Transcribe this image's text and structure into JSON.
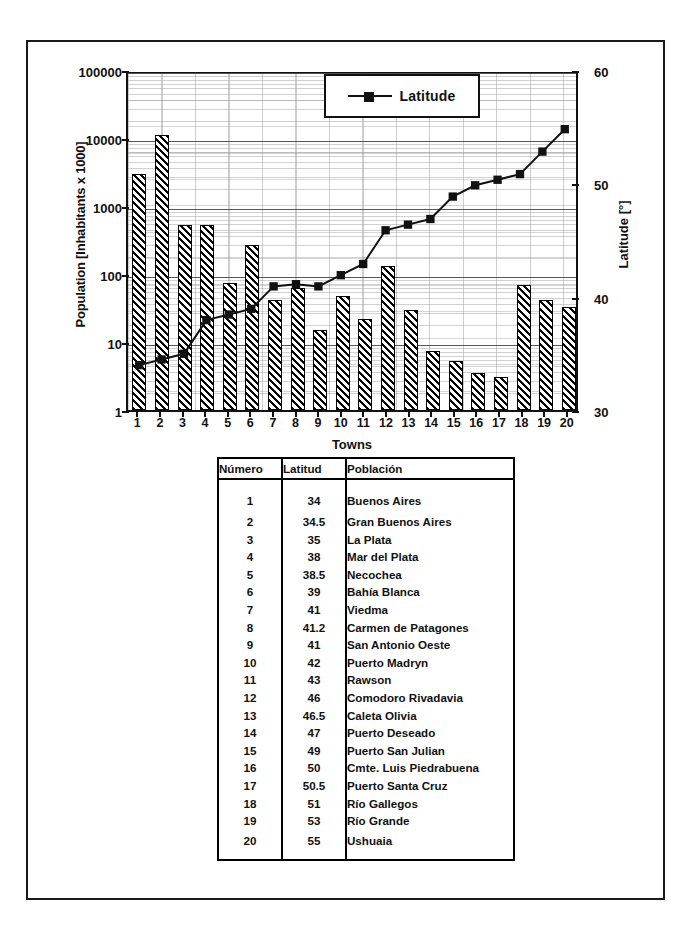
{
  "chart_data": {
    "type": "bar",
    "title": "",
    "xlabel": "Towns",
    "ylabel": "Population [Inhabitants x 1000]",
    "y2label": "Latitude [°]",
    "ylim": [
      1,
      100000
    ],
    "yscale": "log",
    "y2lim": [
      30,
      60
    ],
    "grid": true,
    "legend_position": "top-right",
    "y_ticks": [
      "1",
      "10",
      "100",
      "1000",
      "10000",
      "100000"
    ],
    "y2_ticks": [
      "30",
      "40",
      "50",
      "60"
    ],
    "categories": [
      "1",
      "2",
      "3",
      "4",
      "5",
      "6",
      "7",
      "8",
      "9",
      "10",
      "11",
      "12",
      "13",
      "14",
      "15",
      "16",
      "17",
      "18",
      "19",
      "20"
    ],
    "series": [
      {
        "name": "Population",
        "type": "bar",
        "axis": "left",
        "values": [
          3000,
          11000,
          520,
          520,
          75,
          270,
          41,
          62,
          15,
          47,
          22,
          130,
          30,
          7.5,
          5.2,
          3.5,
          3.1,
          70,
          42,
          33
        ]
      },
      {
        "name": "Latitude",
        "type": "line",
        "axis": "right",
        "values": [
          34,
          34.5,
          35,
          38,
          38.5,
          39,
          41,
          41.2,
          41,
          42,
          43,
          46,
          46.5,
          47,
          49,
          50,
          50.5,
          51,
          53,
          55
        ]
      }
    ]
  },
  "legend": {
    "entry_label": "Latitude"
  },
  "table": {
    "headers": [
      "Número",
      "Latitud",
      "Población"
    ],
    "rows": [
      [
        "1",
        "34",
        "Buenos Aires"
      ],
      [
        "2",
        "34.5",
        "Gran Buenos Aires"
      ],
      [
        "3",
        "35",
        "La Plata"
      ],
      [
        "4",
        "38",
        "Mar del Plata"
      ],
      [
        "5",
        "38.5",
        "Necochea"
      ],
      [
        "6",
        "39",
        "Bahía Blanca"
      ],
      [
        "7",
        "41",
        "Viedma"
      ],
      [
        "8",
        "41.2",
        "Carmen de Patagones"
      ],
      [
        "9",
        "41",
        "San Antonio Oeste"
      ],
      [
        "10",
        "42",
        "Puerto Madryn"
      ],
      [
        "11",
        "43",
        "Rawson"
      ],
      [
        "12",
        "46",
        "Comodoro Rivadavia"
      ],
      [
        "13",
        "46.5",
        "Caleta Olivia"
      ],
      [
        "14",
        "47",
        "Puerto Deseado"
      ],
      [
        "15",
        "49",
        "Puerto San Julian"
      ],
      [
        "16",
        "50",
        "Cmte. Luis Piedrabuena"
      ],
      [
        "17",
        "50.5",
        "Puerto Santa Cruz"
      ],
      [
        "18",
        "51",
        "Río Gallegos"
      ],
      [
        "19",
        "53",
        "Río Grande"
      ],
      [
        "20",
        "55",
        "Ushuaia"
      ]
    ]
  },
  "colors": {
    "ink": "#111111",
    "paper": "#ffffff",
    "grid": "#9a9a9a"
  }
}
